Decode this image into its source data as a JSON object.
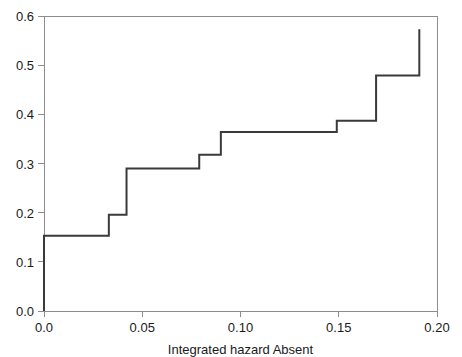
{
  "chart_data": {
    "type": "line",
    "subtype": "step",
    "title": "",
    "subtitle": "",
    "xlabel": "Integrated hazard    Absent",
    "xlabel_parts": [
      "Integrated hazard",
      "Absent"
    ],
    "ylabel": "",
    "xlim": [
      0.0,
      0.2
    ],
    "ylim": [
      0.0,
      0.6
    ],
    "xticks": [
      0.0,
      0.05,
      0.1,
      0.15,
      0.2
    ],
    "xtick_labels": [
      "0.0",
      "0.05",
      "0.10",
      "0.15",
      "0.20"
    ],
    "yticks": [
      0.0,
      0.1,
      0.2,
      0.3,
      0.4,
      0.5,
      0.6
    ],
    "ytick_labels": [
      "0.0",
      "0.1",
      "0.2",
      "0.3",
      "0.4",
      "0.5",
      "0.6"
    ],
    "grid": false,
    "legend": null,
    "legend_position": "none",
    "line_color": "#3a3a3a",
    "axis_color": "#8d8d8d",
    "background_color": "#ffffff",
    "series": [
      {
        "name": "Absent",
        "step_type": "post",
        "x": [
          0.0,
          0.0,
          0.033,
          0.033,
          0.042,
          0.042,
          0.079,
          0.079,
          0.09,
          0.09,
          0.149,
          0.149,
          0.169,
          0.169,
          0.191,
          0.191
        ],
        "y": [
          0.0,
          0.153,
          0.153,
          0.196,
          0.196,
          0.29,
          0.29,
          0.318,
          0.318,
          0.364,
          0.364,
          0.387,
          0.387,
          0.479,
          0.479,
          0.573
        ],
        "jump_points": [
          {
            "x": 0.0,
            "from": 0.0,
            "to": 0.153
          },
          {
            "x": 0.033,
            "from": 0.153,
            "to": 0.196
          },
          {
            "x": 0.042,
            "from": 0.196,
            "to": 0.29
          },
          {
            "x": 0.079,
            "from": 0.29,
            "to": 0.318
          },
          {
            "x": 0.09,
            "from": 0.318,
            "to": 0.364
          },
          {
            "x": 0.149,
            "from": 0.364,
            "to": 0.387
          },
          {
            "x": 0.169,
            "from": 0.387,
            "to": 0.479
          },
          {
            "x": 0.191,
            "from": 0.479,
            "to": 0.573
          }
        ]
      }
    ]
  },
  "geometry": {
    "plot_left": 44,
    "plot_right": 437,
    "plot_top": 16,
    "plot_bottom": 311
  }
}
